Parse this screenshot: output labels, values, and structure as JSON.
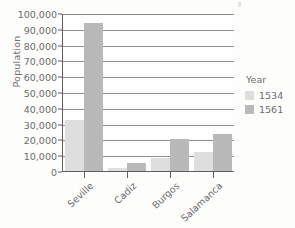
{
  "chart_data": {
    "type": "bar",
    "title": "",
    "subtitle": "",
    "xlabel": "",
    "ylabel": "Population",
    "categories": [
      "Seville",
      "Cadiz",
      "Burgos",
      "Salamanca"
    ],
    "series": [
      {
        "name": "1534",
        "color": "#dedede",
        "values": [
          33000,
          2500,
          9000,
          12500
        ]
      },
      {
        "name": "1561",
        "color": "#b9b9b9",
        "values": [
          94500,
          5500,
          21000,
          24000
        ]
      }
    ],
    "ylim": [
      0,
      100000
    ],
    "ytick_step": 10000,
    "ytick_labels": [
      "0",
      "10,000",
      "20,000",
      "30,000",
      "40,000",
      "50,000",
      "60,000",
      "70,000",
      "80,000",
      "90,000",
      "100,000"
    ],
    "ytick_values": [
      0,
      10000,
      20000,
      30000,
      40000,
      50000,
      60000,
      70000,
      80000,
      90000,
      100000
    ],
    "grid": "horizontal",
    "legend_position": "right",
    "legend_title": "Year",
    "xtick_label_rotation": -43,
    "background_color": "#fdfdfc",
    "axis_color": "#5f5f5f",
    "gridline_color": "#8f8f8f",
    "text_color": "#6b6b6b"
  }
}
